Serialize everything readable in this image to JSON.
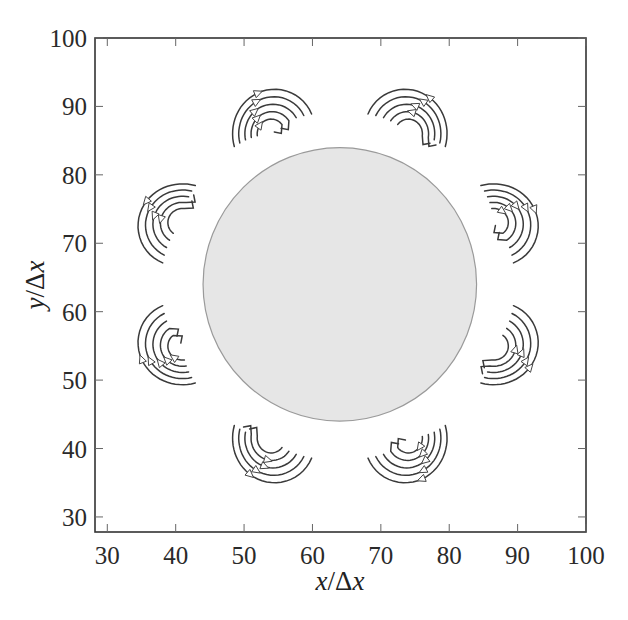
{
  "chart_data": {
    "type": "scatter",
    "title": "",
    "subtitle": "",
    "xlabel": "x/Δx",
    "ylabel": "y/Δx",
    "xlim": [
      28.2,
      100
    ],
    "ylim": [
      27.8,
      100
    ],
    "x_ticks": [
      30,
      40,
      50,
      60,
      70,
      80,
      90,
      100
    ],
    "y_ticks": [
      30,
      40,
      50,
      60,
      70,
      80,
      90,
      100
    ],
    "grid": false,
    "legend": null,
    "body": {
      "shape": "circle",
      "center": [
        64,
        64
      ],
      "radius": 20,
      "fill": "#e6e6e6",
      "edge": "#9a9a9a"
    },
    "vortex_clusters": [
      {
        "id": "upper-left-top",
        "center": [
          53.5,
          86.5
        ],
        "angle_deg": 112.5,
        "arrow_direction": "clockwise"
      },
      {
        "id": "upper-right-top",
        "center": [
          74.5,
          86.5
        ],
        "angle_deg": 67.5,
        "arrow_direction": "counterclockwise"
      },
      {
        "id": "right-upper",
        "center": [
          87.0,
          73.5
        ],
        "angle_deg": 22.5,
        "arrow_direction": "clockwise"
      },
      {
        "id": "right-lower",
        "center": [
          87.0,
          54.5
        ],
        "angle_deg": -22.5,
        "arrow_direction": "counterclockwise"
      },
      {
        "id": "lower-right",
        "center": [
          74.5,
          41.0
        ],
        "angle_deg": -67.5,
        "arrow_direction": "clockwise"
      },
      {
        "id": "lower-left",
        "center": [
          53.5,
          41.0
        ],
        "angle_deg": -112.5,
        "arrow_direction": "counterclockwise"
      },
      {
        "id": "left-lower",
        "center": [
          40.5,
          54.5
        ],
        "angle_deg": -157.5,
        "arrow_direction": "clockwise"
      },
      {
        "id": "left-upper",
        "center": [
          40.5,
          73.5
        ],
        "angle_deg": 157.5,
        "arrow_direction": "counterclockwise"
      }
    ],
    "streamlines_per_cluster": 5,
    "arrow_marker": "open-triangle"
  },
  "axes": {
    "x_tick_labels": [
      "30",
      "40",
      "50",
      "60",
      "70",
      "80",
      "90",
      "100"
    ],
    "y_tick_labels": [
      "30",
      "40",
      "50",
      "60",
      "70",
      "80",
      "90",
      "100"
    ],
    "xlabel_var": "x",
    "xlabel_sep": "/Δ",
    "xlabel_unit": "x",
    "ylabel_var": "y",
    "ylabel_sep": "/Δ",
    "ylabel_unit": "x"
  },
  "layout": {
    "px_left": 95,
    "px_right": 586,
    "px_top": 38,
    "px_bottom": 532
  }
}
